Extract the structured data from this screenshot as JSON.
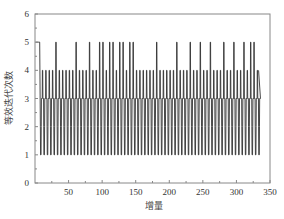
{
  "chart_data": {
    "type": "line",
    "title": "",
    "xlabel": "增量",
    "ylabel": "等效迭代次数",
    "xlim": [
      0,
      350
    ],
    "ylim": [
      0,
      6
    ],
    "xticks": [
      50,
      100,
      150,
      200,
      250,
      300,
      350
    ],
    "xtick_labels": [
      "50",
      "100",
      "150",
      "200",
      "250",
      "300",
      "350"
    ],
    "yticks": [
      0,
      1,
      2,
      3,
      4,
      5,
      6
    ],
    "ytick_labels": [
      "0",
      "1",
      "2",
      "3",
      "4",
      "5",
      "6"
    ],
    "grid": false,
    "legend": null,
    "x_range_of_data": [
      1,
      333
    ],
    "pattern_description": "Oscillating step series: baseline 3, drops to 2 then 1 roughly every 5 increments, with spikes to 4 roughly every 5 increments and occasional spikes to 5.",
    "initial_block": {
      "x_start": 1,
      "x_end": 7,
      "value": 5
    },
    "peaks_5_x": [
      31,
      61,
      79,
      94,
      101,
      109,
      116,
      124,
      133,
      140,
      147,
      179,
      211,
      229,
      246,
      262,
      279,
      295,
      313,
      320,
      328
    ],
    "cycle_period": 5,
    "levels": {
      "baseline": 3,
      "dip_low": 1,
      "dip_mid": 2,
      "spike": 4,
      "spike_high": 5
    },
    "last_x": 333,
    "last_value": 4
  },
  "axes": {
    "x_label": "增量",
    "y_label": "等效迭代次数"
  }
}
